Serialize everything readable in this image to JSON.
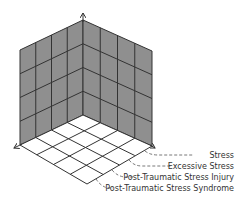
{
  "diagram": {
    "type": "isometric-3d-grid",
    "colors": {
      "wall_fill": "#8f8f8f",
      "floor_fill": "#ffffff",
      "grid_line": "#333333",
      "label_text": "#333333"
    },
    "grid": {
      "wall_columns": 4,
      "wall_rows": 4,
      "floor_rows": 4,
      "floor_columns": 4
    },
    "axes": [
      "vertical-axis",
      "left-axis",
      "right-axis"
    ],
    "labels": [
      {
        "id": "stress",
        "text": "Stress"
      },
      {
        "id": "excessive-stress",
        "text": "Excessive Stress"
      },
      {
        "id": "ptsi",
        "text": "Post-Traumatic Stress Injury"
      },
      {
        "id": "ptss",
        "text": "Post-Traumatic Stress Syndrome"
      }
    ]
  }
}
